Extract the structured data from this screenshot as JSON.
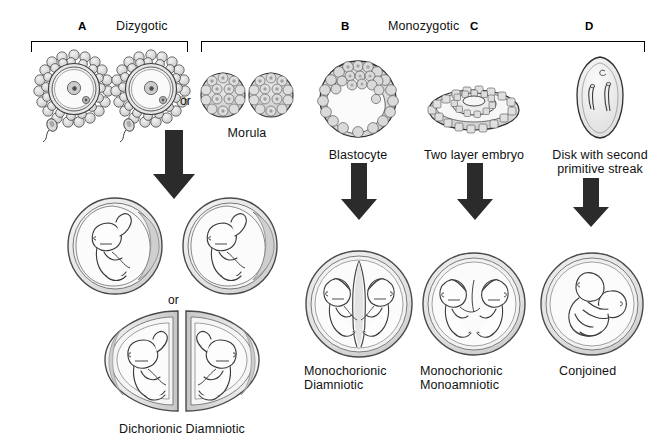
{
  "figure": {
    "background_color": "#ffffff",
    "ink_color": "#111111",
    "arrow_color": "#2b2b2b",
    "shade_light": "#efefef",
    "shade_mid": "#d9d9d9",
    "shade_dark": "#c2c2c2"
  },
  "brackets": {
    "dizygotic": {
      "letter": "A",
      "title": "Dizygotic"
    },
    "monozygotic": {
      "letter_b": "B",
      "letter_c": "C",
      "letter_d": "D",
      "title": "Monozygotic"
    }
  },
  "stages": [
    {
      "id": "ova-sperm",
      "letter": "A",
      "caption": "",
      "description": "two ova each approached by a sperm"
    },
    {
      "id": "morula",
      "letter": "A",
      "caption": "Morula",
      "description": "two separate morulae"
    },
    {
      "id": "blastocyte",
      "letter": "B",
      "caption": "Blastocyte",
      "description": "blastocyst with inner cell mass"
    },
    {
      "id": "two-layer-embryo",
      "letter": "C",
      "caption": "Two layer embryo",
      "description": "bilaminar embryonic disk"
    },
    {
      "id": "disk-second-streak",
      "letter": "D",
      "caption": "Disk with second\nprimitive streak",
      "description": "embryonic disk with two primitive streaks"
    }
  ],
  "connectors": {
    "or_between_ova_and_morula": "or",
    "or_between_outcomes": "or"
  },
  "outcomes": [
    {
      "id": "dichorionic-diamniotic",
      "caption": "Dichorionic Diamniotic",
      "from_letter": "A"
    },
    {
      "id": "monochorionic-diamniotic",
      "caption": "Monochorionic\nDiamniotic",
      "from_letter": "B"
    },
    {
      "id": "monochorionic-monoamniotic",
      "caption": "Monochorionic\nMonoamniotic",
      "from_letter": "C"
    },
    {
      "id": "conjoined",
      "caption": "Conjoined",
      "from_letter": "D"
    }
  ],
  "arrows": [
    {
      "id": "arrow-dizygotic",
      "direction": "down"
    },
    {
      "id": "arrow-blastocyte",
      "direction": "down"
    },
    {
      "id": "arrow-two-layer",
      "direction": "down"
    },
    {
      "id": "arrow-disk",
      "direction": "down"
    }
  ]
}
